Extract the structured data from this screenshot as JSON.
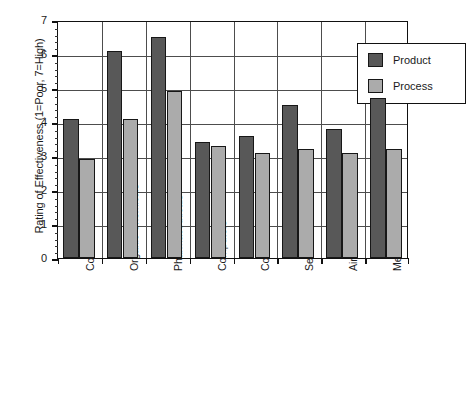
{
  "chart_data": {
    "type": "bar",
    "title": "",
    "xlabel": "",
    "ylabel": "Rating of Effectiveness (1=Poor, 7=High)",
    "ylim": [
      0,
      7
    ],
    "ytick_labels": [
      "0",
      "1",
      "2",
      "3",
      "4",
      "5",
      "6",
      "7"
    ],
    "ytick_values": [
      0,
      1,
      2,
      3,
      4,
      5,
      6,
      7
    ],
    "minor_tick_step": 0.2,
    "grid": "horizontal-major-and-category-separators",
    "legend_position": "top-right-inside",
    "categories": [
      "Cosmetics",
      "Organic Chemicals",
      "Pharmaceuticals",
      "Computers",
      "Communications",
      "Semiconductors",
      "Aircraft",
      "Medical Instruments"
    ],
    "series": [
      {
        "name": "Product",
        "color": "#585858",
        "values": [
          4.1,
          6.1,
          6.5,
          3.4,
          3.6,
          4.5,
          3.8,
          4.7
        ]
      },
      {
        "name": "Process",
        "color": "#ababab",
        "values": [
          2.9,
          4.1,
          4.9,
          3.3,
          3.1,
          3.2,
          3.1,
          3.2
        ]
      }
    ]
  },
  "legend": {
    "entries": [
      {
        "label": "Product",
        "color": "#585858"
      },
      {
        "label": "Process",
        "color": "#ababab"
      }
    ]
  },
  "colors": {
    "product": "#585858",
    "process": "#ababab",
    "frame": "#111111",
    "grid": "#4d4d4d",
    "background": "#ffffff",
    "text": "#1a1a1a"
  }
}
